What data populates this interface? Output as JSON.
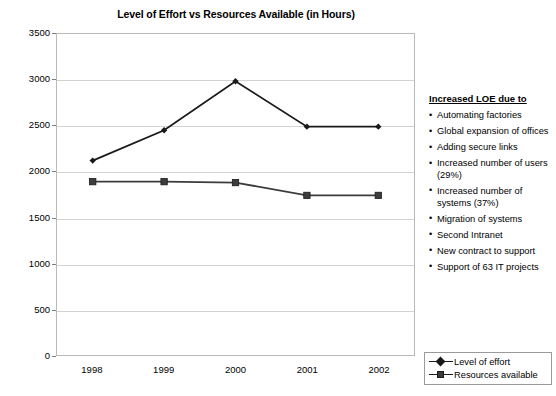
{
  "chart_data": {
    "type": "line",
    "title": "Level of Effort vs Resources Available (in Hours)",
    "xlabel": "",
    "ylabel": "",
    "categories": [
      "1998",
      "1999",
      "2000",
      "2001",
      "2002"
    ],
    "ylim": [
      0,
      3500
    ],
    "yticks": [
      "0",
      "500",
      "1000",
      "1500",
      "2000",
      "2500",
      "3000",
      "3500"
    ],
    "grid": true,
    "legend_position": "bottom-right-outside",
    "series": [
      {
        "name": "Level of effort",
        "marker": "diamond",
        "color": "#1a1a1a",
        "values": [
          2120,
          2450,
          2985,
          2490,
          2490
        ]
      },
      {
        "name": "Resources available",
        "marker": "square",
        "color": "#3c3c3c",
        "values": [
          1890,
          1890,
          1880,
          1740,
          1740
        ]
      }
    ]
  },
  "legend": {
    "items": [
      {
        "label": "Level of effort"
      },
      {
        "label": "Resources available"
      }
    ]
  },
  "side_panel": {
    "heading": "Increased LOE due to",
    "bullets": [
      "Automating factories",
      "Global expansion of offices",
      "Adding secure links",
      "Increased number of users (29%)",
      "Increased number of systems (37%)",
      "Migration of systems",
      "Second Intranet",
      "New contract to support",
      "Support of 63 IT projects"
    ]
  },
  "colors": {
    "series_effort": "#1a1a1a",
    "series_resources": "#3c3c3c",
    "gridline": "#d2d2d2",
    "frame": "#b9b9b9",
    "text": "#000000"
  }
}
